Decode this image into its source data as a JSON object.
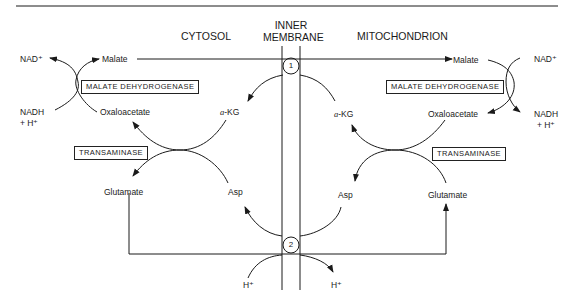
{
  "headers": {
    "cytosol": "CYTOSOL",
    "membrane_line1": "INNER",
    "membrane_line2": "MEMBRANE",
    "mitochondrion": "MITOCHONDRION"
  },
  "cytosol": {
    "nad_plus": "NAD⁺",
    "nadh": "NADH",
    "h_plus": "+ H⁺",
    "malate": "Malate",
    "oxaloacetate": "Oxaloacetate",
    "malate_dehydrogenase": "MALATE DEHYDROGENASE",
    "transaminase": "TRANSAMINASE",
    "glutamate": "Glutamate",
    "asp": "Asp",
    "akg_alpha": "a",
    "akg_rest": "-KG"
  },
  "mitochondrion": {
    "nad_plus": "NAD⁺",
    "nadh": "NADH",
    "h_plus": "+ H⁺",
    "malate": "Malate",
    "oxaloacetate": "Oxaloacetate",
    "malate_dehydrogenase": "MALATE DEHYDROGENASE",
    "transaminase": "TRANSAMINASE",
    "glutamate": "Glutamate",
    "asp": "Asp",
    "akg_alpha": "a",
    "akg_rest": "-KG"
  },
  "transporters": {
    "t1": "1",
    "t2": "2"
  },
  "protons": {
    "h_in": "H⁺",
    "h_out": "H⁺"
  }
}
